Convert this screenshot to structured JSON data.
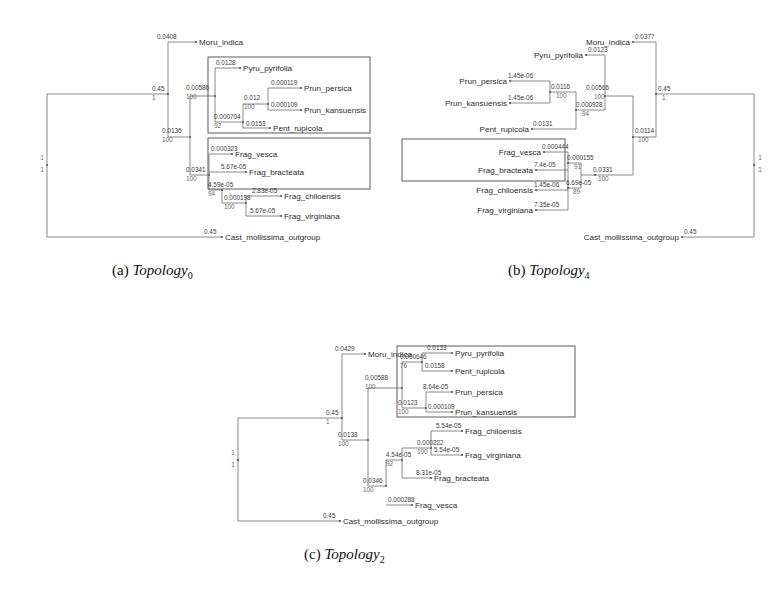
{
  "figure": {
    "type": "phylogenetic-tree-figure",
    "panel_count": 3,
    "taxa": [
      "Moru_indica",
      "Pyru_pyrifolia",
      "Prun_persica",
      "Prun_kansuensis",
      "Pent_rupicola",
      "Frag_vesca",
      "Frag_bracteata",
      "Frag_chiloensis",
      "Frag_virginiana",
      "Cast_mollissima_outgroup"
    ]
  },
  "panels": [
    {
      "id": "a",
      "caption_prefix": "(a)",
      "caption_name": "Topology",
      "caption_sub": "0",
      "orientation": "left-to-right",
      "root_label_top": "1",
      "root_label_bottom": "1",
      "boxes": [
        {
          "name": "rosaceae-clade-box",
          "members": [
            "Pyru_pyrifolia",
            "Prun_persica",
            "Prun_kansuensis",
            "Pent_rupicola"
          ]
        },
        {
          "name": "fragaria-clade-box",
          "members": [
            "Frag_vesca",
            "Frag_bracteata"
          ]
        }
      ],
      "tips": [
        {
          "taxon": "Moru_indica",
          "branch_length": "0.0408"
        },
        {
          "taxon": "Pyru_pyrifolia",
          "branch_length": "0.0128"
        },
        {
          "taxon": "Prun_persica",
          "branch_length": "0.000119"
        },
        {
          "taxon": "Prun_kansuensis",
          "branch_length": "0.000109"
        },
        {
          "taxon": "Pent_rupicola",
          "branch_length": "0.0153"
        },
        {
          "taxon": "Frag_vesca",
          "branch_length": "0.000323"
        },
        {
          "taxon": "Frag_bracteata",
          "branch_length": "5.67e-05"
        },
        {
          "taxon": "Frag_chiloensis",
          "branch_length": "2.83e-05"
        },
        {
          "taxon": "Frag_virginiana",
          "branch_length": "5.67e-05"
        },
        {
          "taxon": "Cast_mollissima_outgroup",
          "branch_length": "0.45"
        }
      ],
      "internal_nodes": [
        {
          "name": "root-split",
          "branch_length": "0.45",
          "support": "1"
        },
        {
          "name": "moru-crown",
          "branch_length": "0.00586",
          "support": "100"
        },
        {
          "name": "prunus-node",
          "branch_length": "0.012",
          "support": "100"
        },
        {
          "name": "pentactina-node",
          "branch_length": "0.000704",
          "support": "92"
        },
        {
          "name": "rosoid-node",
          "branch_length": "0.0136",
          "support": "100"
        },
        {
          "name": "fragaria-crown",
          "branch_length": "0.0341",
          "support": "100"
        },
        {
          "name": "fragaria-sub1",
          "branch_length": "4.59e-05",
          "support": "94"
        },
        {
          "name": "fragaria-sub2",
          "branch_length": "0.000198",
          "support": "100"
        }
      ]
    },
    {
      "id": "b",
      "caption_prefix": "(b)",
      "caption_name": "Topology",
      "caption_sub": "4",
      "orientation": "right-to-left",
      "root_label_top": "1",
      "root_label_bottom": "1",
      "boxes": [
        {
          "name": "fragaria-clade-box",
          "members": [
            "Frag_vesca",
            "Frag_bracteata"
          ]
        }
      ],
      "tips": [
        {
          "taxon": "Moru_indica",
          "branch_length": "0.0377"
        },
        {
          "taxon": "Pyru_pyrifolia",
          "branch_length": "0.0123"
        },
        {
          "taxon": "Prun_persica",
          "branch_length": "1.45e-06"
        },
        {
          "taxon": "Prun_kansuensis",
          "branch_length": "1.45e-06"
        },
        {
          "taxon": "Pent_rupicola",
          "branch_length": "0.0131"
        },
        {
          "taxon": "Frag_vesca",
          "branch_length": "0.000444"
        },
        {
          "taxon": "Frag_bracteata",
          "branch_length": "7.4e-05"
        },
        {
          "taxon": "Frag_chiloensis",
          "branch_length": "1.45e-06"
        },
        {
          "taxon": "Frag_virginiana",
          "branch_length": "7.35e-05"
        },
        {
          "taxon": "Cast_mollissima_outgroup",
          "branch_length": "0.45"
        }
      ],
      "internal_nodes": [
        {
          "name": "root-split",
          "branch_length": "0.45",
          "support": "1"
        },
        {
          "name": "moru-crown",
          "branch_length": "0.00566",
          "support": "100"
        },
        {
          "name": "prunus-node",
          "branch_length": "0.0116",
          "support": "100"
        },
        {
          "name": "pentactina-node",
          "branch_length": "0.000928",
          "support": "94"
        },
        {
          "name": "rosoid-node",
          "branch_length": "0.0114",
          "support": "100"
        },
        {
          "name": "fragaria-crown",
          "branch_length": "0.0331",
          "support": "100"
        },
        {
          "name": "fragaria-sub1",
          "branch_length": "0.000155",
          "support": "91"
        },
        {
          "name": "fragaria-sub2",
          "branch_length": "6.69e-05",
          "support": "89"
        }
      ]
    },
    {
      "id": "c",
      "caption_prefix": "(c)",
      "caption_name": "Topology",
      "caption_sub": "2",
      "orientation": "left-to-right",
      "root_label_top": "1",
      "root_label_bottom": "1",
      "boxes": [
        {
          "name": "rosaceae-clade-box",
          "members": [
            "Pyru_pyrifolia",
            "Pent_rupicola",
            "Prun_persica",
            "Prun_kansuensis"
          ]
        }
      ],
      "tips": [
        {
          "taxon": "Moru_indica",
          "branch_length": "0.0429"
        },
        {
          "taxon": "Pyru_pyrifolia",
          "branch_length": "0.0133"
        },
        {
          "taxon": "Pent_rupicola",
          "branch_length": "0.0158"
        },
        {
          "taxon": "Prun_persica",
          "branch_length": "8.64e-05"
        },
        {
          "taxon": "Prun_kansuensis",
          "branch_length": "0.000109"
        },
        {
          "taxon": "Frag_chiloensis",
          "branch_length": "5.54e-05"
        },
        {
          "taxon": "Frag_virginiana",
          "branch_length": "5.54e-05"
        },
        {
          "taxon": "Frag_bracteata",
          "branch_length": "8.31e-05"
        },
        {
          "taxon": "Frag_vesca",
          "branch_length": "0.000288"
        },
        {
          "taxon": "Cast_mollissima_outgroup",
          "branch_length": "0.45"
        }
      ],
      "internal_nodes": [
        {
          "name": "root-split",
          "branch_length": "0.45",
          "support": "1"
        },
        {
          "name": "moru-crown",
          "branch_length": "0.00588",
          "support": "100"
        },
        {
          "name": "pyrus-pent-node",
          "branch_length": "0.000646",
          "support": "76"
        },
        {
          "name": "prunus-node",
          "branch_length": "0.0123",
          "support": "100"
        },
        {
          "name": "rosoid-node",
          "branch_length": "0.0138",
          "support": "100"
        },
        {
          "name": "fragaria-crown",
          "branch_length": "0.0346",
          "support": "100"
        },
        {
          "name": "fragaria-sub1",
          "branch_length": "4.54e-05",
          "support": "92"
        },
        {
          "name": "fragaria-sub2",
          "branch_length": "0.000222",
          "support": "100"
        }
      ]
    }
  ]
}
